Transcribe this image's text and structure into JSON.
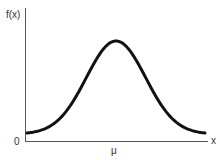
{
  "chart_data": {
    "type": "line",
    "title": "",
    "xlabel": "x",
    "ylabel": "f(x)",
    "origin_label": "0",
    "x_tick_labels": [
      "μ"
    ],
    "series": [
      {
        "name": "f(x)",
        "distribution": "normal",
        "mean_label": "μ",
        "x": [
          -3,
          -2.5,
          -2,
          -1.5,
          -1,
          -0.5,
          0,
          0.5,
          1,
          1.5,
          2,
          2.5,
          3
        ],
        "values": [
          0.011,
          0.044,
          0.135,
          0.325,
          0.607,
          0.882,
          1.0,
          0.882,
          0.607,
          0.325,
          0.135,
          0.044,
          0.011
        ]
      }
    ],
    "grid": false,
    "legend": "none",
    "colors": {
      "curve": "#111111",
      "axes": "#555555",
      "text": "#333333"
    }
  },
  "labels": {
    "y_axis": "f(x)",
    "x_axis": "x",
    "origin": "0",
    "mean": "μ"
  }
}
